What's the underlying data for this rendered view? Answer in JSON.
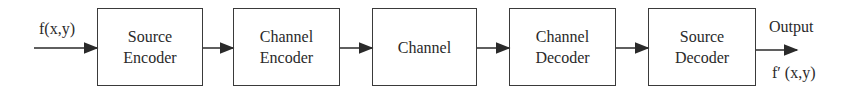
{
  "diagram": {
    "type": "block-diagram",
    "input_label": "f(x,y)",
    "output_label": "Output",
    "output_signal": "f′ (x,y)",
    "blocks": [
      {
        "line1": "Source",
        "line2": "Encoder"
      },
      {
        "line1": "Channel",
        "line2": "Encoder"
      },
      {
        "line1": "Channel",
        "line2": ""
      },
      {
        "line1": "Channel",
        "line2": "Decoder"
      },
      {
        "line1": "Source",
        "line2": "Decoder"
      }
    ],
    "colors": {
      "stroke": "#3a3a3a",
      "text": "#2a2a2a",
      "background": "#ffffff"
    }
  }
}
